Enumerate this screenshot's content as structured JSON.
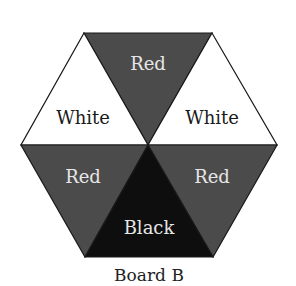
{
  "diagram": {
    "title": "Board B",
    "colors": {
      "red": "#4b4b4b",
      "black": "#0e0e0e",
      "white": "#ffffff",
      "outline": "#1a1a1a",
      "light_text": "#e6e6e6",
      "dark_text": "#1a1a1a"
    },
    "segments": [
      {
        "position": "top",
        "label": "Red"
      },
      {
        "position": "upper-left",
        "label": "White"
      },
      {
        "position": "upper-right",
        "label": "White"
      },
      {
        "position": "lower-left",
        "label": "Red"
      },
      {
        "position": "lower-right",
        "label": "Red"
      },
      {
        "position": "bottom",
        "label": "Black"
      }
    ]
  }
}
